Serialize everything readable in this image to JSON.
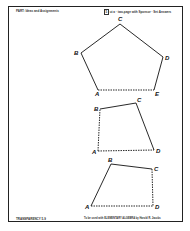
{
  "header": {
    "left_text": "PART: Ideas and Assignments",
    "right_box": "5",
    "right_text": "ut a · two-page with Sponsor · Set Answers"
  },
  "footer": {
    "left_text": "TRANSPARENCY 5-9",
    "right_text": "To be used with ELEMENTARY ALGEBRA by Harold R. Jacobs"
  },
  "figures": [
    {
      "name": "pentagon",
      "vertices": [
        {
          "label": "A",
          "x": 98,
          "y": 90
        },
        {
          "label": "B",
          "x": 81,
          "y": 53
        },
        {
          "label": "C",
          "x": 120,
          "y": 24
        },
        {
          "label": "D",
          "x": 163,
          "y": 57
        },
        {
          "label": "E",
          "x": 154,
          "y": 90
        }
      ]
    },
    {
      "name": "quadrilateral-1",
      "vertices": [
        {
          "label": "A",
          "x": 98,
          "y": 151
        },
        {
          "label": "B",
          "x": 100,
          "y": 109
        },
        {
          "label": "C",
          "x": 136,
          "y": 103
        },
        {
          "label": "D",
          "x": 154,
          "y": 150
        }
      ]
    },
    {
      "name": "quadrilateral-2",
      "vertices": [
        {
          "label": "A",
          "x": 91,
          "y": 206
        },
        {
          "label": "B",
          "x": 111,
          "y": 164
        },
        {
          "label": "C",
          "x": 152,
          "y": 169
        },
        {
          "label": "D",
          "x": 153,
          "y": 206
        }
      ]
    }
  ]
}
